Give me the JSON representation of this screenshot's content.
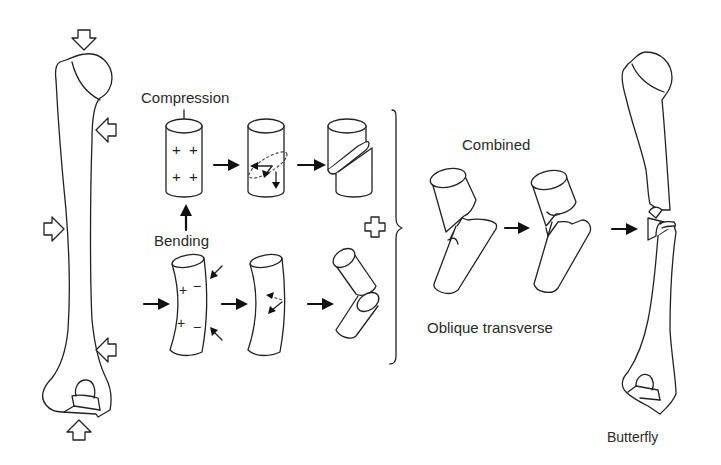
{
  "diagram": {
    "labels": {
      "compression": "Compression",
      "bending": "Bending",
      "combined": "Combined",
      "oblique_transverse": "Oblique transverse",
      "butterfly": "Butterfly"
    },
    "symbols": {
      "plus": "+",
      "minus": "−"
    },
    "stroke_color": "#222222",
    "background_color": "#ffffff"
  }
}
